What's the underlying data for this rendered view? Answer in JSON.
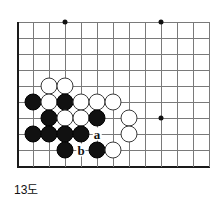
{
  "figure": {
    "caption": "13도",
    "kind": "go-board-diagram"
  },
  "board": {
    "origin_x": 17,
    "origin_y": 22,
    "spacing": 16,
    "cols": 13,
    "rows": 10,
    "line_color": "#7a7a7a",
    "edge_color": "#1a1a1a",
    "background": "#ffffff",
    "edges": {
      "left": true,
      "bottom": true,
      "top": false,
      "right": false
    },
    "star_points": [
      {
        "col": 3,
        "row": 0
      },
      {
        "col": 9,
        "row": 0
      },
      {
        "col": 9,
        "row": 6
      }
    ],
    "stones": [
      {
        "color": "white",
        "col": 2,
        "row": 4
      },
      {
        "color": "white",
        "col": 3,
        "row": 4
      },
      {
        "color": "black",
        "col": 1,
        "row": 5
      },
      {
        "color": "white",
        "col": 2,
        "row": 5
      },
      {
        "color": "black",
        "col": 3,
        "row": 5
      },
      {
        "color": "white",
        "col": 4,
        "row": 5
      },
      {
        "color": "white",
        "col": 5,
        "row": 5
      },
      {
        "color": "white",
        "col": 6,
        "row": 5
      },
      {
        "color": "black",
        "col": 2,
        "row": 6
      },
      {
        "color": "white",
        "col": 3,
        "row": 6
      },
      {
        "color": "white",
        "col": 4,
        "row": 6
      },
      {
        "color": "black",
        "col": 5,
        "row": 6
      },
      {
        "color": "white",
        "col": 7,
        "row": 6
      },
      {
        "color": "black",
        "col": 1,
        "row": 7
      },
      {
        "color": "black",
        "col": 2,
        "row": 7
      },
      {
        "color": "black",
        "col": 3,
        "row": 7
      },
      {
        "color": "black",
        "col": 4,
        "row": 7
      },
      {
        "color": "white",
        "col": 7,
        "row": 7
      },
      {
        "color": "black",
        "col": 3,
        "row": 8
      },
      {
        "color": "black",
        "col": 5,
        "row": 8
      },
      {
        "color": "white",
        "col": 6,
        "row": 8
      }
    ],
    "labels": [
      {
        "text": "a",
        "col": 5,
        "row": 7
      },
      {
        "text": "b",
        "col": 4,
        "row": 8
      }
    ]
  }
}
